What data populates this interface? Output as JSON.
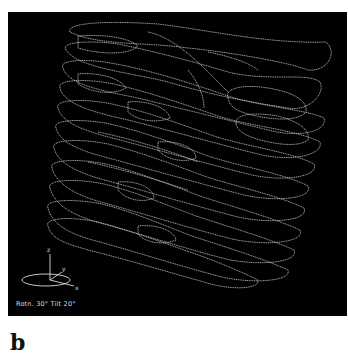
{
  "figure": {
    "panel_label": "b",
    "view_caption": "Rotn. 30° Tilt 20°",
    "axes": {
      "z": "z",
      "y": "y",
      "x": "x"
    },
    "colors": {
      "background": "#000000",
      "contour": "#d8d8d8",
      "page": "#ffffff"
    }
  }
}
